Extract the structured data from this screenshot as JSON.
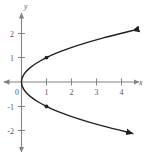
{
  "chart_data": {
    "type": "line",
    "title": "",
    "subtitle": "",
    "xlabel": "x",
    "ylabel": "y",
    "xlim": [
      -0.45,
      4.9
    ],
    "ylim": [
      -2.55,
      2.55
    ],
    "grid": false,
    "legend": null,
    "x_ticks": [
      1,
      2,
      3,
      4
    ],
    "x_tick_labels": [
      "1",
      "2",
      "3",
      "4"
    ],
    "y_ticks": [
      -2,
      -1,
      1,
      2
    ],
    "y_tick_labels": [
      "-2",
      "-1",
      "1",
      "2"
    ],
    "origin_label": "0",
    "series": [
      {
        "name": "x = y^2",
        "equation": "x = y^2",
        "orientation": "opens-right",
        "vertex": [
          0,
          0
        ],
        "arrow_start": true,
        "arrow_end": true,
        "points_x": [
          4.45,
          3.24,
          2.25,
          1.44,
          1.0,
          0.64,
          0.36,
          0.16,
          0.04,
          0.0,
          0.04,
          0.16,
          0.36,
          0.64,
          1.0,
          1.44,
          2.25,
          3.24,
          4.45
        ],
        "points_y": [
          2.11,
          1.8,
          1.5,
          1.2,
          1.0,
          0.8,
          0.6,
          0.4,
          0.2,
          0.0,
          -0.2,
          -0.4,
          -0.6,
          -0.8,
          -1.0,
          -1.2,
          -1.5,
          -1.8,
          -2.11
        ]
      }
    ],
    "marked_points": [
      {
        "label": "",
        "x": 1,
        "y": 1
      },
      {
        "label": "",
        "x": 1,
        "y": -1
      }
    ],
    "colors": {
      "curve": "#231f20",
      "axis": "#808285",
      "tick_text": "#58595b",
      "point": "#231f20",
      "background": "#ffffff"
    }
  }
}
